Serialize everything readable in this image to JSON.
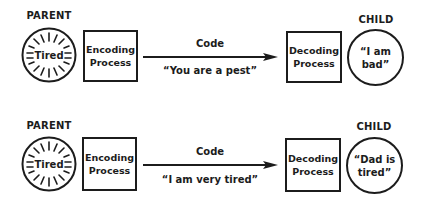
{
  "diagrams": [
    {
      "sender_label": "PARENT",
      "sender_state": "Tired",
      "encoder": "Encoding Process",
      "encoder_lines": [
        "Encoding",
        "Process"
      ],
      "channel_label": "Code",
      "message": "“You are a pest”",
      "decoder_lines": [
        "Decoding",
        "Process"
      ],
      "receiver_label": "CHILD",
      "receiver_lines": [
        "“I am",
        "bad”"
      ]
    },
    {
      "sender_label": "PARENT",
      "sender_state": "Tired",
      "encoder_lines": [
        "Encoding",
        "Process"
      ],
      "channel_label": "Code",
      "message": "“I am very tired”",
      "decoder_lines": [
        "Decoding",
        "Process"
      ],
      "receiver_label": "CHILD",
      "receiver_lines": [
        "“Dad is",
        "tired”"
      ]
    }
  ],
  "colors": {
    "ink": "#1c1c1c",
    "background": "#ffffff"
  }
}
